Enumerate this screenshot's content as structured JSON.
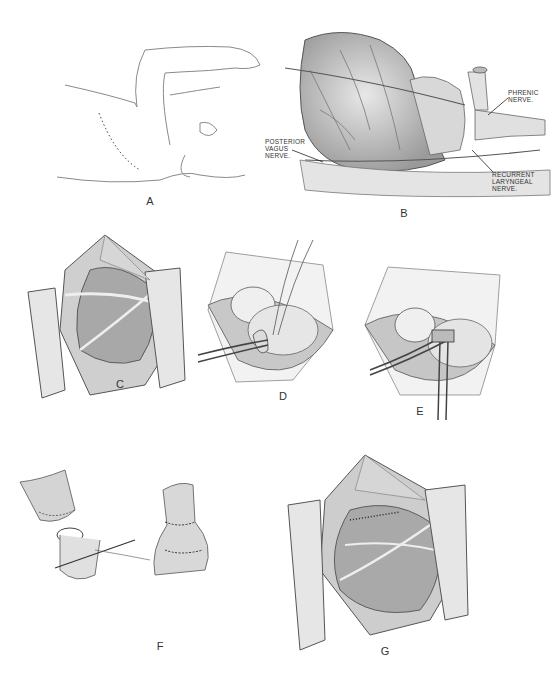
{
  "figure": {
    "panels": [
      {
        "id": "A",
        "label": "A",
        "description": "Patient positioned on side, arm raised, dotted incision line"
      },
      {
        "id": "B",
        "label": "B",
        "description": "Heart and great vessels with nerves labelled"
      },
      {
        "id": "C",
        "label": "C",
        "description": "Exposure through retracted incision"
      },
      {
        "id": "D",
        "label": "D",
        "description": "Vessel encircled with ligatures"
      },
      {
        "id": "E",
        "label": "E",
        "description": "Vessel clamped"
      },
      {
        "id": "F",
        "label": "F",
        "description": "Anastomosis steps of divided vessel"
      },
      {
        "id": "G",
        "label": "G",
        "description": "Completed repair with suture line"
      }
    ],
    "annotations": {
      "phrenic": [
        "PHRENIC",
        "NERVE."
      ],
      "posterior_vagus": [
        "POSTERIOR",
        "VAGUS",
        "NERVE."
      ],
      "recurrent_laryngeal": [
        "RECURRENT",
        "LARYNGEAL",
        "NERVE."
      ]
    }
  }
}
